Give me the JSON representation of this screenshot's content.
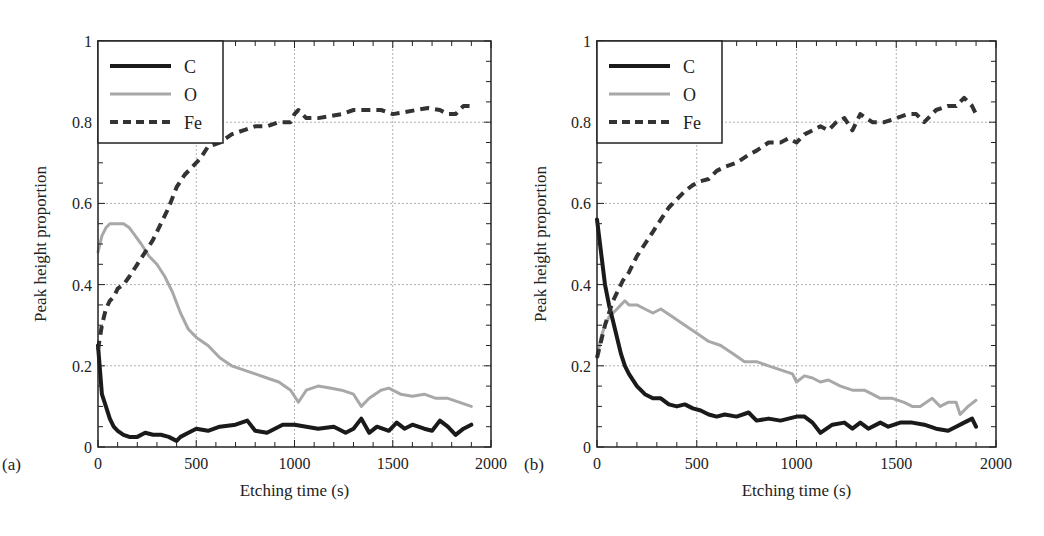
{
  "figure": {
    "panels": [
      {
        "label": "(a)",
        "xlabel": "Etching time (s)",
        "ylabel": "Peak height proportion"
      },
      {
        "label": "(b)",
        "xlabel": "Etching time (s)",
        "ylabel": "Peak height proportion"
      }
    ]
  },
  "colors": {
    "C": "#1a1a1a",
    "O": "#a8a8a8",
    "Fe": "#333333",
    "grid": "#b0b0b0",
    "axis": "#222222"
  },
  "chart_data": [
    {
      "type": "line",
      "panel": "(a)",
      "title": "",
      "xlabel": "Etching time (s)",
      "ylabel": "Peak height proportion",
      "xlim": [
        0,
        2000
      ],
      "ylim": [
        0,
        1
      ],
      "xticks": [
        0,
        500,
        1000,
        1500,
        2000
      ],
      "yticks": [
        0,
        0.2,
        0.4,
        0.6,
        0.8,
        1
      ],
      "ytick_labels": [
        "0",
        "0.2",
        "0.4",
        "0.6",
        "0.8",
        "1"
      ],
      "grid": true,
      "legend": {
        "position": "upper left",
        "entries": [
          "C",
          "O",
          "Fe"
        ]
      },
      "series": [
        {
          "name": "C",
          "style": "solid-thick-black",
          "x": [
            0,
            20,
            40,
            60,
            80,
            100,
            130,
            160,
            200,
            240,
            280,
            320,
            360,
            400,
            420,
            460,
            500,
            560,
            620,
            700,
            760,
            800,
            860,
            940,
            1000,
            1060,
            1120,
            1200,
            1260,
            1300,
            1340,
            1380,
            1420,
            1480,
            1520,
            1560,
            1600,
            1660,
            1700,
            1740,
            1780,
            1820,
            1860,
            1900
          ],
          "values": [
            0.25,
            0.13,
            0.1,
            0.07,
            0.05,
            0.04,
            0.03,
            0.025,
            0.025,
            0.035,
            0.03,
            0.03,
            0.025,
            0.015,
            0.025,
            0.035,
            0.045,
            0.04,
            0.05,
            0.055,
            0.065,
            0.04,
            0.035,
            0.055,
            0.055,
            0.05,
            0.045,
            0.05,
            0.035,
            0.045,
            0.07,
            0.035,
            0.05,
            0.04,
            0.06,
            0.045,
            0.055,
            0.045,
            0.04,
            0.065,
            0.05,
            0.03,
            0.045,
            0.055
          ]
        },
        {
          "name": "O",
          "style": "solid-gray",
          "x": [
            0,
            20,
            40,
            60,
            80,
            100,
            130,
            160,
            190,
            220,
            260,
            300,
            340,
            380,
            420,
            460,
            500,
            560,
            620,
            680,
            740,
            800,
            860,
            920,
            980,
            1020,
            1060,
            1120,
            1180,
            1240,
            1300,
            1340,
            1380,
            1440,
            1480,
            1540,
            1600,
            1660,
            1720,
            1780,
            1840,
            1900
          ],
          "values": [
            0.48,
            0.52,
            0.54,
            0.55,
            0.55,
            0.55,
            0.55,
            0.54,
            0.52,
            0.5,
            0.47,
            0.45,
            0.42,
            0.38,
            0.33,
            0.29,
            0.27,
            0.25,
            0.22,
            0.2,
            0.19,
            0.18,
            0.17,
            0.16,
            0.14,
            0.11,
            0.14,
            0.15,
            0.145,
            0.14,
            0.13,
            0.1,
            0.12,
            0.14,
            0.145,
            0.13,
            0.125,
            0.13,
            0.12,
            0.12,
            0.11,
            0.1
          ]
        },
        {
          "name": "Fe",
          "style": "dashed-dark",
          "x": [
            0,
            20,
            40,
            60,
            80,
            100,
            130,
            160,
            200,
            240,
            280,
            320,
            360,
            400,
            440,
            480,
            520,
            560,
            620,
            680,
            740,
            800,
            860,
            920,
            980,
            1000,
            1020,
            1060,
            1120,
            1180,
            1240,
            1300,
            1380,
            1440,
            1500,
            1560,
            1620,
            1680,
            1740,
            1780,
            1820,
            1860,
            1900
          ],
          "values": [
            0.24,
            0.3,
            0.34,
            0.36,
            0.37,
            0.39,
            0.4,
            0.42,
            0.45,
            0.48,
            0.51,
            0.55,
            0.59,
            0.64,
            0.67,
            0.69,
            0.71,
            0.74,
            0.75,
            0.77,
            0.78,
            0.79,
            0.79,
            0.8,
            0.8,
            0.82,
            0.83,
            0.81,
            0.81,
            0.815,
            0.82,
            0.83,
            0.83,
            0.83,
            0.82,
            0.825,
            0.83,
            0.835,
            0.83,
            0.82,
            0.82,
            0.84,
            0.84
          ]
        }
      ]
    },
    {
      "type": "line",
      "panel": "(b)",
      "title": "",
      "xlabel": "Etching time (s)",
      "ylabel": "Peak height proportion",
      "xlim": [
        0,
        2000
      ],
      "ylim": [
        0,
        1
      ],
      "xticks": [
        0,
        500,
        1000,
        1500,
        2000
      ],
      "yticks": [
        0,
        0.2,
        0.4,
        0.6,
        0.8,
        1
      ],
      "ytick_labels": [
        "0",
        "0.2",
        "0.4",
        "0.6",
        "0.8",
        "1"
      ],
      "grid": true,
      "legend": {
        "position": "upper left",
        "entries": [
          "C",
          "O",
          "Fe"
        ]
      },
      "series": [
        {
          "name": "C",
          "style": "solid-thick-black",
          "x": [
            0,
            20,
            40,
            60,
            80,
            100,
            120,
            140,
            160,
            200,
            240,
            280,
            320,
            360,
            400,
            440,
            480,
            520,
            560,
            600,
            640,
            700,
            760,
            800,
            860,
            920,
            960,
            1000,
            1040,
            1080,
            1120,
            1180,
            1240,
            1280,
            1320,
            1360,
            1420,
            1460,
            1520,
            1580,
            1640,
            1700,
            1760,
            1800,
            1840,
            1880,
            1900
          ],
          "values": [
            0.56,
            0.48,
            0.4,
            0.35,
            0.31,
            0.27,
            0.23,
            0.2,
            0.18,
            0.15,
            0.13,
            0.12,
            0.12,
            0.105,
            0.1,
            0.105,
            0.095,
            0.09,
            0.08,
            0.075,
            0.08,
            0.075,
            0.085,
            0.065,
            0.07,
            0.065,
            0.07,
            0.075,
            0.075,
            0.06,
            0.035,
            0.055,
            0.06,
            0.045,
            0.06,
            0.045,
            0.06,
            0.05,
            0.06,
            0.06,
            0.055,
            0.045,
            0.04,
            0.05,
            0.06,
            0.07,
            0.05
          ]
        },
        {
          "name": "O",
          "style": "solid-light-gray",
          "x": [
            0,
            20,
            40,
            60,
            80,
            100,
            120,
            140,
            160,
            200,
            240,
            280,
            320,
            380,
            440,
            500,
            560,
            620,
            680,
            740,
            800,
            860,
            920,
            980,
            1000,
            1040,
            1080,
            1120,
            1160,
            1220,
            1280,
            1340,
            1380,
            1420,
            1480,
            1540,
            1580,
            1620,
            1680,
            1720,
            1760,
            1800,
            1820,
            1860,
            1900
          ],
          "values": [
            0.22,
            0.27,
            0.3,
            0.32,
            0.33,
            0.34,
            0.35,
            0.36,
            0.35,
            0.35,
            0.34,
            0.33,
            0.34,
            0.32,
            0.3,
            0.28,
            0.26,
            0.25,
            0.23,
            0.21,
            0.21,
            0.2,
            0.19,
            0.18,
            0.16,
            0.175,
            0.17,
            0.16,
            0.165,
            0.15,
            0.14,
            0.14,
            0.13,
            0.12,
            0.12,
            0.11,
            0.1,
            0.1,
            0.12,
            0.1,
            0.11,
            0.11,
            0.08,
            0.1,
            0.115
          ]
        },
        {
          "name": "Fe",
          "style": "dashed-dark",
          "x": [
            0,
            20,
            40,
            60,
            80,
            100,
            130,
            160,
            200,
            240,
            280,
            320,
            360,
            400,
            440,
            480,
            520,
            560,
            600,
            640,
            700,
            760,
            800,
            860,
            920,
            960,
            1000,
            1040,
            1080,
            1120,
            1160,
            1200,
            1240,
            1280,
            1320,
            1380,
            1440,
            1500,
            1560,
            1600,
            1640,
            1700,
            1760,
            1800,
            1840,
            1880,
            1900
          ],
          "values": [
            0.22,
            0.26,
            0.3,
            0.33,
            0.36,
            0.38,
            0.41,
            0.43,
            0.47,
            0.5,
            0.53,
            0.56,
            0.59,
            0.61,
            0.63,
            0.645,
            0.655,
            0.66,
            0.68,
            0.69,
            0.7,
            0.72,
            0.73,
            0.75,
            0.75,
            0.76,
            0.75,
            0.77,
            0.78,
            0.79,
            0.78,
            0.8,
            0.81,
            0.78,
            0.82,
            0.8,
            0.8,
            0.81,
            0.82,
            0.82,
            0.8,
            0.83,
            0.84,
            0.84,
            0.86,
            0.84,
            0.82
          ]
        }
      ]
    }
  ]
}
